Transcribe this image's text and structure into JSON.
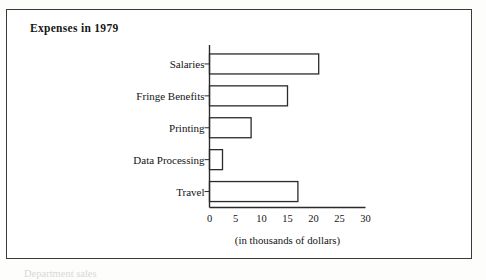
{
  "figure": {
    "title": "Expenses in 1979",
    "axis_caption": "(in thousands of dollars)",
    "footer_partial": "Department sales",
    "border_color": "#3a3a3a",
    "bar_outline_color": "#2b2b2b",
    "bar_fill_color": "#ffffff",
    "background_color": "#ffffff"
  },
  "chart_data": {
    "type": "bar",
    "orientation": "horizontal",
    "title": "Expenses in 1979",
    "xlabel": "(in thousands of dollars)",
    "ylabel": "",
    "categories": [
      "Salaries",
      "Fringe Benefits",
      "Printing",
      "Data Processing",
      "Travel"
    ],
    "values": [
      21,
      15,
      8,
      2.5,
      17
    ],
    "xlim": [
      0,
      30
    ],
    "xticks": [
      0,
      5,
      10,
      15,
      20,
      25,
      30
    ],
    "xticklabels": [
      "0",
      "5",
      "10",
      "15",
      "20",
      "25",
      "30"
    ],
    "grid": false,
    "legend": false,
    "units": "thousands of dollars",
    "bars": [
      {
        "label": "Salaries",
        "value": 21
      },
      {
        "label": "Fringe Benefits",
        "value": 15
      },
      {
        "label": "Printing",
        "value": 8
      },
      {
        "label": "Data Processing",
        "value": 2.5
      },
      {
        "label": "Travel",
        "value": 17
      }
    ]
  }
}
